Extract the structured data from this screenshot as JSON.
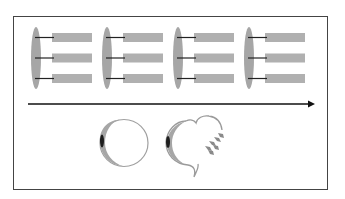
{
  "diagram": {
    "title": "",
    "colors": {
      "frame": "#444444",
      "membrane": "#a6a6a6",
      "bar": "#b0b0b0",
      "linker": "#222222",
      "arrow": "#111111",
      "cell_outline": "#9a9a9a",
      "nucleus": "#1e1e1e",
      "fragments": "#8a8a8a"
    },
    "top_row": {
      "groups": [
        {
          "id": "stage-1",
          "x": 31,
          "bars": 3
        },
        {
          "id": "stage-2",
          "x": 102,
          "bars": 3
        },
        {
          "id": "stage-3",
          "x": 173,
          "bars": 3
        },
        {
          "id": "stage-4",
          "x": 244,
          "bars": 3
        }
      ]
    },
    "arrow": {
      "direction": "right",
      "label": ""
    },
    "bottom_row": {
      "cells": [
        {
          "id": "intact-cell",
          "state": "intact"
        },
        {
          "id": "blebbing-cell",
          "state": "disrupted, releasing fragments"
        }
      ]
    }
  }
}
